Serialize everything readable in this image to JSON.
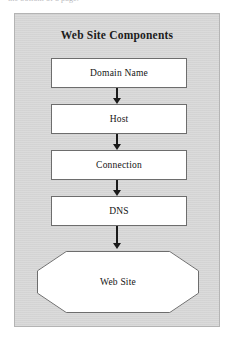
{
  "page": {
    "caption_fragment": "the bottom of a page."
  },
  "figure": {
    "title": "Web Site Components",
    "background_color": "#d6d6d6",
    "border_color": "#b4b4b4",
    "node_fill_color": "#ffffff",
    "node_border_color": "#6d6d6d",
    "arrow_color": "#1a1a1a",
    "flow_direction": "top-to-bottom",
    "nodes": [
      {
        "label": "Domain Name",
        "shape": "rectangle"
      },
      {
        "label": "Host",
        "shape": "rectangle"
      },
      {
        "label": "Connection",
        "shape": "rectangle"
      },
      {
        "label": "DNS",
        "shape": "rectangle"
      },
      {
        "label": "Web Site",
        "shape": "octagon"
      }
    ],
    "connectors": [
      {
        "from": "Domain Name",
        "to": "Host",
        "type": "arrow-down"
      },
      {
        "from": "Host",
        "to": "Connection",
        "type": "arrow-down"
      },
      {
        "from": "Connection",
        "to": "DNS",
        "type": "arrow-down"
      },
      {
        "from": "DNS",
        "to": "Web Site",
        "type": "arrow-down"
      }
    ]
  }
}
